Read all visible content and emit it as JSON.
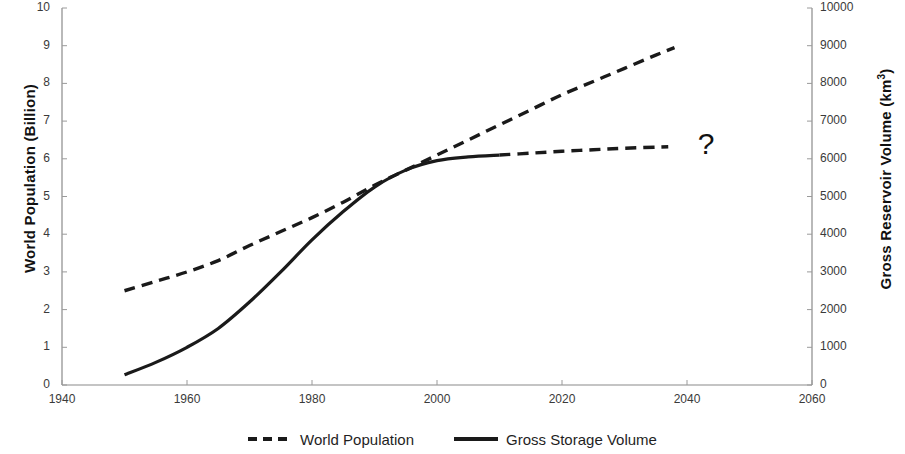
{
  "chart_data": {
    "type": "line",
    "title": "",
    "xlabel": "",
    "xlim": [
      1940,
      2060
    ],
    "xticks": [
      1940,
      1960,
      1980,
      2000,
      2020,
      2040,
      2060
    ],
    "grid": false,
    "legend_position": "bottom",
    "axes": {
      "left": {
        "label": "World Population (Billion)",
        "ylim": [
          0,
          10
        ],
        "yticks": [
          0,
          1,
          2,
          3,
          4,
          5,
          6,
          7,
          8,
          9,
          10
        ],
        "ticklabels": [
          "0",
          "1",
          "2",
          "3",
          "4",
          "5",
          "6",
          "7",
          "8",
          "9",
          "10"
        ]
      },
      "right": {
        "label": "Gross Reservoir Volume (km3)",
        "label_base": "Gross Reservoir Volume (km",
        "label_sup": "3",
        "label_tail": ")",
        "ylim": [
          0,
          10000
        ],
        "yticks": [
          0,
          1000,
          2000,
          3000,
          4000,
          5000,
          6000,
          7000,
          8000,
          9000,
          10000
        ],
        "ticklabels": [
          "0",
          "1000",
          "2000",
          "3000",
          "4000",
          "5000",
          "6000",
          "7000",
          "8000",
          "9000",
          "10000"
        ]
      }
    },
    "series": [
      {
        "name": "World Population",
        "style": "dashed",
        "axis": "left",
        "unit": "Billion",
        "color": "#1a1a1a",
        "x": [
          1950,
          1955,
          1960,
          1965,
          1970,
          1975,
          1980,
          1985,
          1990,
          1995,
          2000,
          2005,
          2010,
          2015,
          2020,
          2025,
          2030,
          2035,
          2038
        ],
        "y": [
          2.5,
          2.75,
          3.0,
          3.3,
          3.7,
          4.07,
          4.44,
          4.85,
          5.3,
          5.7,
          6.1,
          6.5,
          6.9,
          7.3,
          7.7,
          8.05,
          8.4,
          8.75,
          8.95
        ]
      },
      {
        "name": "Gross Storage Volume",
        "style": "solid",
        "axis": "right",
        "unit": "km3",
        "color": "#1a1a1a",
        "x": [
          1950,
          1955,
          1960,
          1965,
          1970,
          1975,
          1980,
          1985,
          1990,
          1995,
          2000,
          2005,
          2010
        ],
        "y": [
          270,
          600,
          1000,
          1500,
          2200,
          3000,
          3850,
          4600,
          5250,
          5700,
          5950,
          6050,
          6100
        ]
      },
      {
        "name": "Gross Storage Volume (projected)",
        "style": "dashed",
        "axis": "right",
        "unit": "km3",
        "color": "#1a1a1a",
        "x": [
          2010,
          2015,
          2020,
          2025,
          2030,
          2037
        ],
        "y": [
          6100,
          6150,
          6200,
          6240,
          6280,
          6320
        ]
      }
    ],
    "annotations": [
      {
        "text": "?",
        "x": 2043,
        "y_right": 6250,
        "name": "question-mark-annotation"
      }
    ],
    "legend": [
      {
        "label": "World Population",
        "style": "dashed"
      },
      {
        "label": "Gross Storage Volume",
        "style": "solid"
      }
    ]
  }
}
